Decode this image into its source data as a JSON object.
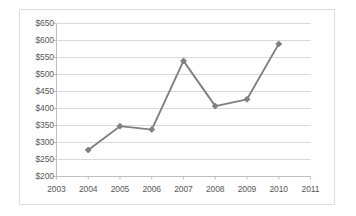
{
  "chart_data": {
    "type": "line",
    "title": "",
    "subtitle": "",
    "xlabel": "",
    "ylabel": "",
    "x": [
      2004,
      2005,
      2006,
      2007,
      2008,
      2009,
      2010
    ],
    "categories": [
      "2004",
      "2005",
      "2006",
      "2007",
      "2008",
      "2009",
      "2010"
    ],
    "values": [
      278,
      348,
      338,
      540,
      407,
      427,
      590
    ],
    "series": [
      {
        "name": "",
        "values": [
          278,
          348,
          338,
          540,
          407,
          427,
          590
        ]
      }
    ],
    "xlim": [
      2003,
      2011
    ],
    "ylim": [
      200,
      650
    ],
    "x_tick_labels": [
      "2003",
      "2004",
      "2005",
      "2006",
      "2007",
      "2008",
      "2009",
      "2010",
      "2011"
    ],
    "x_tick_values": [
      2003,
      2004,
      2005,
      2006,
      2007,
      2008,
      2009,
      2010,
      2011
    ],
    "y_tick_labels": [
      "$200",
      "$250",
      "$300",
      "$350",
      "$400",
      "$450",
      "$500",
      "$550",
      "$600",
      "$650"
    ],
    "y_tick_values": [
      200,
      250,
      300,
      350,
      400,
      450,
      500,
      550,
      600,
      650
    ],
    "grid": {
      "horizontal": true,
      "vertical": false
    },
    "legend": {
      "visible": false,
      "position": "none",
      "entries": []
    },
    "annotations": [],
    "marker": "diamond",
    "colors": {
      "line": "#808080",
      "marker": "#7f7f7f",
      "grid": "#d9d9d9",
      "axis": "#bfbfbf",
      "tick_text": "#58585a",
      "frame_border": "#dededd",
      "background": "#ffffff"
    }
  }
}
